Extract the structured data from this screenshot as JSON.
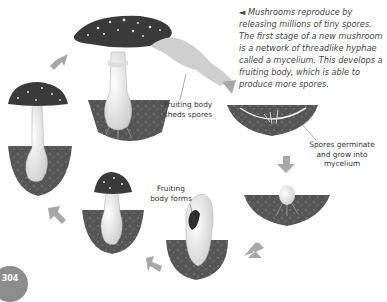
{
  "caption": {
    "marker": "◄",
    "text": "Mushrooms reproduce by releasing millions of tiny spores. The first stage of a new mushroom is a network of threadlike hyphae called a mycelium. This develops a fruiting body, which is able to produce more spores."
  },
  "labels": {
    "sheds_spores": "Fruiting body sheds spores",
    "germinate": "Spores germinate and grow into mycelium",
    "forms": "Fruiting body forms"
  },
  "page_number": "304",
  "stages": [
    "Mature mushroom shedding spores",
    "Spores germinate into mycelium",
    "Button emerges from mycelium",
    "Fruiting body forms",
    "Young mushroom with cap",
    "Mushroom grows taller"
  ],
  "colors": {
    "cap": "#3a3a3a",
    "soil": "#5a5a5a",
    "stem": "#e8e8e8",
    "arrow": "#a8a8a8",
    "spore_cloud": "#cfcfcf"
  }
}
